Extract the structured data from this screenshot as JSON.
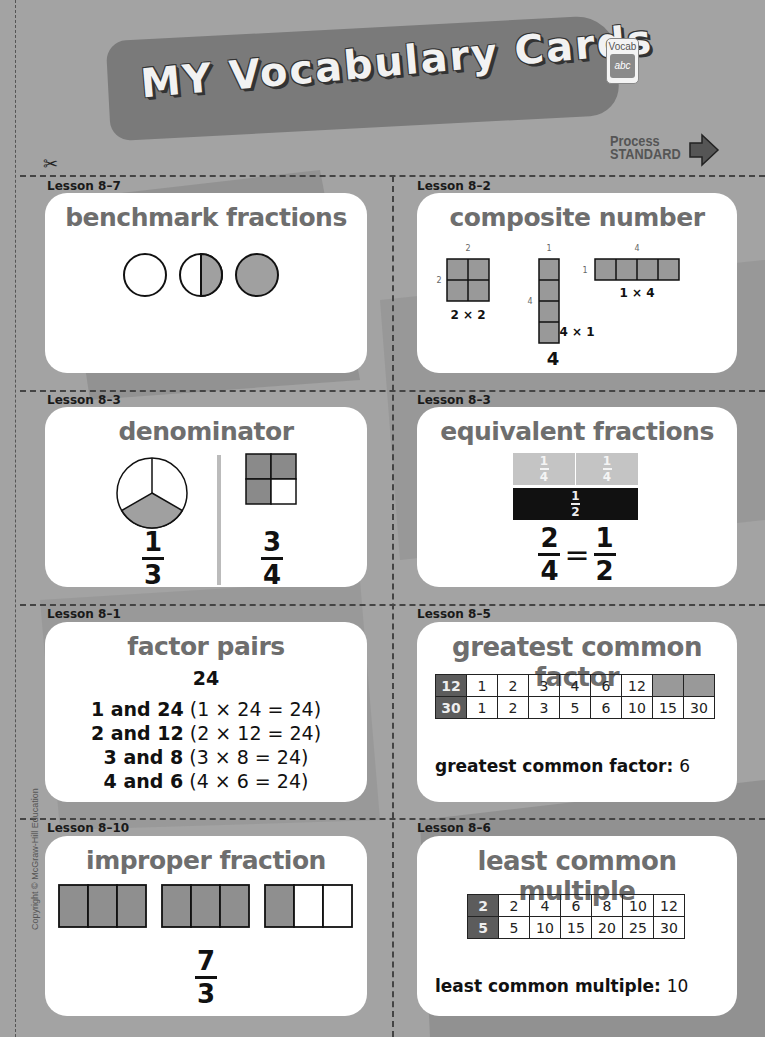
{
  "header": {
    "title": "MY Vocabulary Cards",
    "badge_label": "Vocab",
    "badge_icon_text": "abc",
    "process_line1": "Process",
    "process_line2": "STANDARD"
  },
  "copyright": "Copyright © McGraw-Hill Education",
  "cards": {
    "benchmark": {
      "lesson": "Lesson 8–7",
      "title": "benchmark fractions",
      "circles": [
        "0",
        "1/2",
        "1"
      ]
    },
    "composite": {
      "lesson": "Lesson 8–2",
      "title": "composite number",
      "arrays": [
        {
          "label": "2 × 2",
          "top": "2",
          "side": "2"
        },
        {
          "label": "4 × 1",
          "top": "1",
          "side": "4"
        },
        {
          "label": "1 × 4",
          "top": "4",
          "side": "1"
        }
      ],
      "number": "4"
    },
    "denominator": {
      "lesson": "Lesson 8–3",
      "title": "denominator",
      "left_fraction": {
        "num": "1",
        "den": "3"
      },
      "right_fraction": {
        "num": "3",
        "den": "4"
      }
    },
    "equivalent": {
      "lesson": "Lesson 8–3",
      "title": "equivalent fractions",
      "quarter_num": "1",
      "quarter_den": "4",
      "half_num": "1",
      "half_den": "2",
      "eq_left": {
        "num": "2",
        "den": "4"
      },
      "eq_sign": "=",
      "eq_right": {
        "num": "1",
        "den": "2"
      }
    },
    "factor_pairs": {
      "lesson": "Lesson 8–1",
      "title": "factor pairs",
      "number": "24",
      "lines": [
        {
          "bold": "1 and 24",
          "rest": " (1 × 24 = 24)"
        },
        {
          "bold": "2 and 12",
          "rest": " (2 × 12 = 24)"
        },
        {
          "bold": "3 and 8",
          "rest": " (3 × 8 = 24)"
        },
        {
          "bold": "4 and 6",
          "rest": " (4 × 6 = 24)"
        }
      ]
    },
    "gcf": {
      "lesson": "Lesson 8–5",
      "title": "greatest common factor",
      "rows": [
        {
          "head": "12",
          "cells": [
            "1",
            "2",
            "3",
            "4",
            "6",
            "12",
            "",
            ""
          ]
        },
        {
          "head": "30",
          "cells": [
            "1",
            "2",
            "3",
            "5",
            "6",
            "10",
            "15",
            "30"
          ]
        }
      ],
      "result_label": "greatest common factor:",
      "result_value": "6"
    },
    "improper": {
      "lesson": "Lesson 8–10",
      "title": "improper fraction",
      "shaded_thirds": 7,
      "fraction": {
        "num": "7",
        "den": "3"
      }
    },
    "lcm": {
      "lesson": "Lesson 8–6",
      "title": "least common multiple",
      "rows": [
        {
          "head": "2",
          "cells": [
            "2",
            "4",
            "6",
            "8",
            "10",
            "12"
          ]
        },
        {
          "head": "5",
          "cells": [
            "5",
            "10",
            "15",
            "20",
            "25",
            "30"
          ]
        }
      ],
      "result_label": "least common multiple:",
      "result_value": "10"
    }
  }
}
